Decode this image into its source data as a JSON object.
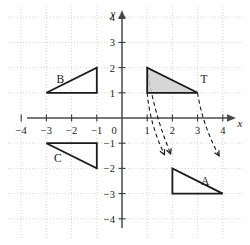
{
  "figure": {
    "title": "",
    "type": "coordinate-plane-transformation-diagram",
    "width": 250,
    "height": 245
  },
  "axes": {
    "x_name": "x",
    "y_name": "y",
    "origin_label": "0",
    "xlim": [
      -4.6,
      4.6
    ],
    "ylim": [
      -4.6,
      4.6
    ],
    "x_ticks": [
      -4,
      -3,
      -2,
      -1,
      1,
      2,
      3,
      4
    ],
    "y_ticks": [
      4,
      3,
      2,
      1,
      -1,
      -2,
      -3,
      -4
    ],
    "x_tick_labels": [
      "−4",
      "−3",
      "−2",
      "−1",
      "1",
      "2",
      "3",
      "4"
    ],
    "y_tick_labels": [
      "4",
      "3",
      "2",
      "1",
      "−1",
      "−2",
      "−3",
      "−4"
    ],
    "grid": true,
    "grid_color": "#c9c9c9",
    "axis_color": "#4a4a4a"
  },
  "chart_data": {
    "type": "scatter",
    "title": "",
    "xlabel": "x",
    "ylabel": "y",
    "xlim": [
      -4.6,
      4.6
    ],
    "ylim": [
      -4.6,
      4.6
    ],
    "grid": true,
    "shapes": [
      {
        "label": "T",
        "shaded": true,
        "fill": "#cfcfcf",
        "vertices": [
          [
            1,
            2
          ],
          [
            1,
            1
          ],
          [
            3,
            1
          ]
        ],
        "label_pos": [
          3.25,
          1.55
        ]
      },
      {
        "label": "B",
        "shaded": false,
        "fill": "none",
        "vertices": [
          [
            -3,
            1
          ],
          [
            -1,
            1
          ],
          [
            -1,
            2
          ]
        ],
        "label_pos": [
          -2.45,
          1.55
        ]
      },
      {
        "label": "C",
        "shaded": false,
        "fill": "none",
        "vertices": [
          [
            -3,
            -1
          ],
          [
            -1,
            -1
          ],
          [
            -1,
            -2
          ]
        ],
        "label_pos": [
          -2.55,
          -1.6
        ]
      },
      {
        "label": "A",
        "shaded": false,
        "fill": "none",
        "vertices": [
          [
            2,
            -2
          ],
          [
            2,
            -3
          ],
          [
            4,
            -3
          ]
        ],
        "label_pos": [
          3.3,
          -2.5
        ]
      }
    ],
    "mapping_arrows": [
      {
        "from": [
          1,
          2
        ],
        "to": [
          1.93,
          -1.42
        ]
      },
      {
        "from": [
          1,
          1
        ],
        "to": [
          1.68,
          -1.45
        ]
      },
      {
        "from": [
          3,
          1
        ],
        "to": [
          3.85,
          -1.5
        ]
      }
    ]
  },
  "labels": {
    "shape_t": "T",
    "shape_b": "B",
    "shape_c": "C",
    "shape_a": "A"
  }
}
